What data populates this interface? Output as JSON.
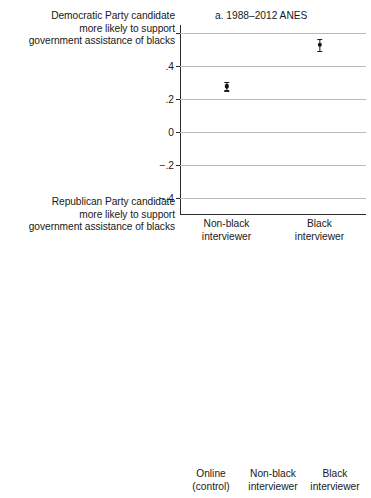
{
  "figure": {
    "axis_top_anchor": {
      "line1": "Democratic Party candidate",
      "line2": "more likely to support",
      "line3": "government assistance of blacks"
    },
    "axis_bottom_anchor": {
      "line1": "Republican Party candidate",
      "line2": "more likely to support",
      "line3": "government assistance of blacks"
    }
  },
  "chart_data": [
    {
      "type": "scatter",
      "panel_id": "a",
      "title": "a. 1988–2012 ANES",
      "xlabel": "",
      "ylabel": "",
      "ylim": [
        -0.5,
        0.65
      ],
      "grid": true,
      "yticks": [
        0.6,
        0.4,
        0.2,
        0,
        -0.2,
        -0.4
      ],
      "ytick_labels": [
        "",
        ".4",
        ".2",
        "0",
        "−.2",
        "−.4"
      ],
      "categories": [
        "Non-black interviewer",
        "Black interviewer"
      ],
      "category_lines": [
        [
          "Non-black",
          "interviewer"
        ],
        [
          "Black",
          "interviewer"
        ]
      ],
      "values": [
        0.28,
        0.53
      ],
      "ci_low": [
        0.255,
        0.495
      ],
      "ci_high": [
        0.305,
        0.565
      ],
      "legend": "none"
    },
    {
      "type": "scatter",
      "panel_id": "b",
      "title": "b. 2012 ANES",
      "xlabel": "",
      "ylabel": "",
      "ylim": [
        -0.5,
        0.65
      ],
      "grid": true,
      "yticks": [
        0.6,
        0.4,
        0.2,
        0,
        -0.2,
        -0.4
      ],
      "ytick_labels": [
        "",
        ".4",
        ".2",
        "0",
        "−.2",
        "−.4"
      ],
      "categories": [
        "Online (control)",
        "Non-black interviewer",
        "Black interviewer"
      ],
      "category_lines": [
        [
          "Online",
          "(control)"
        ],
        [
          "Non-black",
          "interviewer"
        ],
        [
          "Black",
          "interviewer"
        ]
      ],
      "values": [
        0.39,
        0.36,
        0.6
      ],
      "ci_low": [
        0.365,
        0.315,
        0.565
      ],
      "ci_high": [
        0.415,
        0.405,
        0.635
      ],
      "legend": "none"
    }
  ]
}
